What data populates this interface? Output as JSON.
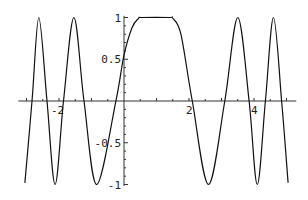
{
  "chart_data": {
    "type": "line",
    "title": "",
    "xlabel": "",
    "ylabel": "",
    "xlim": [
      -3.25,
      5.3
    ],
    "ylim": [
      -1,
      1
    ],
    "grid": false,
    "legend": null,
    "x_ticks": [
      {
        "value": -2,
        "label": "-2"
      },
      {
        "value": 2,
        "label": "2"
      },
      {
        "value": 4,
        "label": "4"
      }
    ],
    "y_ticks": [
      {
        "value": 1,
        "label": "1"
      },
      {
        "value": 0.5,
        "label": "0.5"
      },
      {
        "value": -0.5,
        "label": "-0.5"
      },
      {
        "value": -1,
        "label": "-1"
      }
    ],
    "series": [
      {
        "name": "f(x)",
        "color": "#111111",
        "points": [
          [
            -3.05,
            -0.98
          ],
          [
            -2.83,
            0.0
          ],
          [
            -2.62,
            1.0
          ],
          [
            -2.37,
            0.0
          ],
          [
            -2.12,
            -1.0
          ],
          [
            -1.86,
            0.0
          ],
          [
            -1.54,
            1.0
          ],
          [
            -1.23,
            0.0
          ],
          [
            -0.84,
            -1.0
          ],
          [
            -0.25,
            0.0
          ],
          [
            0.0,
            0.55
          ],
          [
            0.25,
            0.88
          ],
          [
            0.45,
            0.99
          ],
          [
            0.55,
            1.0
          ],
          [
            1.4,
            1.0
          ],
          [
            1.5,
            0.99
          ],
          [
            1.75,
            0.8
          ],
          [
            2.1,
            0.0
          ],
          [
            2.6,
            -1.0
          ],
          [
            3.1,
            0.0
          ],
          [
            3.5,
            1.0
          ],
          [
            3.85,
            0.0
          ],
          [
            4.1,
            -1.0
          ],
          [
            4.35,
            0.0
          ],
          [
            4.6,
            1.0
          ],
          [
            4.85,
            0.0
          ],
          [
            5.05,
            -0.98
          ]
        ]
      }
    ]
  },
  "axes": {
    "origin_px": [
      124,
      101
    ],
    "x_scale_px": 32.5,
    "y_scale_px": 83.5
  }
}
